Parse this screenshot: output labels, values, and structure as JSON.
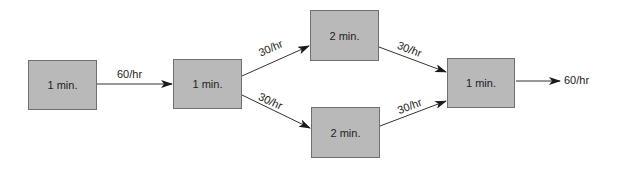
{
  "diagram": {
    "type": "process-flow",
    "colors": {
      "node_fill": "#b9b9b9",
      "node_border": "#6f6f6f",
      "edge": "#333333",
      "background": "#ffffff"
    },
    "nodes": [
      {
        "id": "n1",
        "label": "1 min."
      },
      {
        "id": "n2",
        "label": "1 min."
      },
      {
        "id": "n3",
        "label": "2 min."
      },
      {
        "id": "n4",
        "label": "2 min."
      },
      {
        "id": "n5",
        "label": "1 min."
      }
    ],
    "edges": [
      {
        "from": "n1",
        "to": "n2",
        "label": "60/hr"
      },
      {
        "from": "n2",
        "to": "n3",
        "label": "30/hr"
      },
      {
        "from": "n2",
        "to": "n4",
        "label": "30/hr"
      },
      {
        "from": "n3",
        "to": "n5",
        "label": "30/hr"
      },
      {
        "from": "n4",
        "to": "n5",
        "label": "30/hr"
      },
      {
        "from": "n5",
        "to": "output",
        "label": "60/hr"
      }
    ]
  }
}
